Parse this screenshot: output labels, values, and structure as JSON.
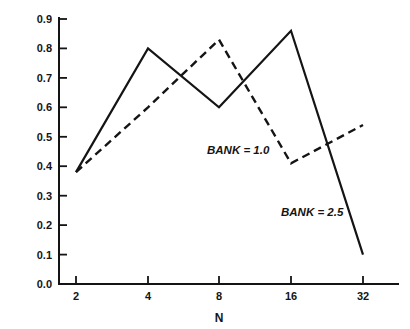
{
  "chart_data": {
    "type": "line",
    "title": "",
    "subtitle": "",
    "xlabel": "N",
    "ylabel": "",
    "x": [
      2,
      4,
      8,
      16,
      32
    ],
    "categories": [
      "2",
      "4",
      "8",
      "16",
      "32"
    ],
    "xtick_labels": [
      "2",
      "4",
      "8",
      "16",
      "32"
    ],
    "ytick_labels": [
      "0.0",
      "0.1",
      "0.2",
      "0.3",
      "0.4",
      "0.5",
      "0.6",
      "0.7",
      "0.8",
      "0.9"
    ],
    "ylim": [
      0.0,
      0.9
    ],
    "xscale": "log2-categorical",
    "grid": false,
    "legend_position": "inline-annotations",
    "series": [
      {
        "name": "BANK = 2.5",
        "style": "solid",
        "values": [
          0.38,
          0.8,
          0.6,
          0.86,
          0.1
        ]
      },
      {
        "name": "BANK = 1.0",
        "style": "dashed",
        "values": [
          0.38,
          0.6,
          0.83,
          0.41,
          0.54
        ]
      }
    ],
    "annotations": [
      {
        "text": "BANK = 1.0",
        "x": 8,
        "y": 0.49
      },
      {
        "text": "BANK = 2.5",
        "x": 16,
        "y": 0.215
      }
    ]
  },
  "axes": {
    "x_axis_name": "N",
    "y_axis_name": ""
  }
}
